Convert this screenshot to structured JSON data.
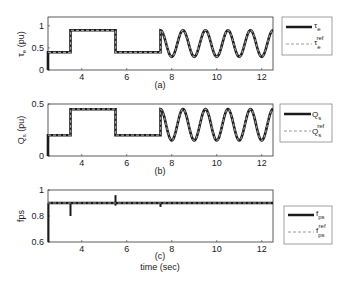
{
  "chart_data": [
    {
      "type": "line",
      "panel_label": "(a)",
      "ylabel": "τe (pu)",
      "xlim": [
        2.5,
        12.5
      ],
      "ylim": [
        0,
        1.2
      ],
      "xticks": [
        4,
        6,
        8,
        10,
        12
      ],
      "yticks": [
        0,
        0.5,
        1
      ],
      "ytick_labels": [
        "0",
        "0.5",
        "1"
      ],
      "legend": [
        "τe",
        "τe ref"
      ],
      "series": [
        {
          "name": "τe",
          "style": "solid-thick",
          "description": "step 0.4 (2.5-3.5), 0.9 (3.5-5.5), 0.4 (5.5-7.5), then sinusoid 0.6±0.3 period 1s to 12.5"
        },
        {
          "name": "τe ref",
          "style": "dashed-gray"
        }
      ],
      "segments": [
        {
          "x0": 2.5,
          "x1": 3.5,
          "y": 0.4
        },
        {
          "x0": 3.5,
          "x1": 5.5,
          "y": 0.9
        },
        {
          "x0": 5.5,
          "x1": 7.5,
          "y": 0.4
        }
      ],
      "sine": {
        "x0": 7.5,
        "x1": 12.5,
        "offset": 0.6,
        "amp": 0.3,
        "period": 1.0
      }
    },
    {
      "type": "line",
      "panel_label": "(b)",
      "ylabel": "Qs (pu)",
      "xlim": [
        2.5,
        12.5
      ],
      "ylim": [
        0,
        0.5
      ],
      "xticks": [
        4,
        6,
        8,
        10,
        12
      ],
      "yticks": [
        0,
        0.5
      ],
      "ytick_labels": [
        "0",
        "0.5"
      ],
      "legend": [
        "Qs",
        "Qs ref"
      ],
      "series": [
        {
          "name": "Qs",
          "style": "solid-thick"
        },
        {
          "name": "Qs ref",
          "style": "dashed-gray"
        }
      ],
      "segments": [
        {
          "x0": 2.5,
          "x1": 3.5,
          "y": 0.2
        },
        {
          "x0": 3.5,
          "x1": 5.5,
          "y": 0.45
        },
        {
          "x0": 5.5,
          "x1": 7.5,
          "y": 0.2
        }
      ],
      "sine": {
        "x0": 7.5,
        "x1": 12.5,
        "offset": 0.3,
        "amp": 0.15,
        "period": 1.0
      }
    },
    {
      "type": "line",
      "panel_label": "(c)",
      "xlabel": "time (sec)",
      "ylabel": "fps",
      "xlim": [
        2.5,
        12.5
      ],
      "ylim": [
        0.6,
        1.0
      ],
      "xticks": [
        4,
        6,
        8,
        10,
        12
      ],
      "yticks": [
        0.6,
        0.8,
        1.0
      ],
      "ytick_labels": [
        "0.6",
        "0.8",
        "1"
      ],
      "legend": [
        "fps",
        "fps ref"
      ],
      "series": [
        {
          "name": "fps",
          "style": "solid-thick",
          "value": 0.9
        },
        {
          "name": "fps ref",
          "style": "dashed-gray",
          "value": 0.9
        }
      ],
      "spikes": [
        {
          "x": 2.52,
          "y0": 0.6,
          "y1": 0.9
        },
        {
          "x": 3.5,
          "y0": 0.8,
          "y1": 0.9
        },
        {
          "x": 5.5,
          "y0": 0.88,
          "y1": 0.96
        },
        {
          "x": 7.5,
          "y0": 0.87,
          "y1": 0.9
        }
      ]
    }
  ],
  "labels": {
    "a": {
      "ylabel_main": "τ",
      "ylabel_sub": "e",
      "ylabel_unit": " (pu)",
      "panel": "(a)",
      "leg1_main": "τ",
      "leg1_sub": "e",
      "leg2_main": "τ",
      "leg2_sub": "e",
      "leg2_sup": "ref"
    },
    "b": {
      "ylabel_main": "Q",
      "ylabel_sub": "s",
      "ylabel_unit": " (pu)",
      "panel": "(b)",
      "leg1_main": "Q",
      "leg1_sub": "s",
      "leg2_main": "Q",
      "leg2_sub": "s",
      "leg2_sup": "ref"
    },
    "c": {
      "ylabel_main": "fps",
      "panel": "(c)",
      "xlabel": "time (sec)",
      "leg1_main": "f",
      "leg1_sub": "ps",
      "leg2_main": "f",
      "leg2_sub": "ps",
      "leg2_sup": "ref"
    }
  },
  "colors": {
    "main": "#1a1a1a",
    "ref": "#9a9a9a",
    "axis": "#333333"
  }
}
